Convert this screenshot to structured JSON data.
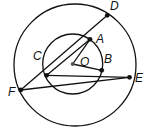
{
  "diagram": {
    "type": "geometry",
    "circles": [
      {
        "name": "outer-circle",
        "cx": 75,
        "cy": 65,
        "r": 61
      },
      {
        "name": "inner-circle",
        "cx": 72.7,
        "cy": 64,
        "r": 30
      }
    ],
    "points": {
      "D": {
        "label": "D",
        "x": 107.3,
        "y": 15.3,
        "lx": 110,
        "ly": 10
      },
      "A": {
        "label": "A",
        "x": 90,
        "y": 39.3,
        "lx": 96,
        "ly": 43
      },
      "O": {
        "label": "O",
        "x": 72.7,
        "y": 64,
        "lx": 80,
        "ly": 66
      },
      "B": {
        "label": "B",
        "x": 101.7,
        "y": 70.3,
        "lx": 104,
        "ly": 63
      },
      "C": {
        "label": "C",
        "x": 46.7,
        "y": 75.3,
        "lx": 33,
        "ly": 60
      },
      "E": {
        "label": "E",
        "x": 129.5,
        "y": 77.3,
        "lx": 135,
        "ly": 82
      },
      "F": {
        "label": "F",
        "x": 20.7,
        "y": 90,
        "lx": 8,
        "ly": 96
      }
    },
    "segments": [
      [
        "F",
        "D"
      ],
      [
        "C",
        "A"
      ],
      [
        "O",
        "A"
      ],
      [
        "O",
        "B"
      ],
      [
        "C",
        "E"
      ],
      [
        "F",
        "E"
      ]
    ],
    "colors": {
      "stroke": "#111111",
      "point": "#111111",
      "center": "#555555"
    }
  }
}
